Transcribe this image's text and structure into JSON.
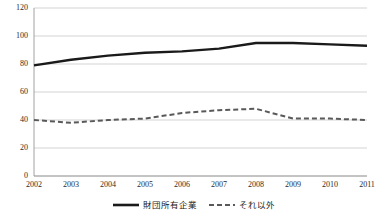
{
  "chart_data": {
    "type": "line",
    "title": "",
    "subtitle": "",
    "xlabel": "",
    "ylabel": "",
    "x": [
      2002,
      2003,
      2004,
      2005,
      2006,
      2007,
      2008,
      2009,
      2010,
      2011
    ],
    "categories": [
      "2002",
      "2003",
      "2004",
      "2005",
      "2006",
      "2007",
      "2008",
      "2009",
      "2010",
      "2011"
    ],
    "series": [
      {
        "name": "財団所有企業",
        "style": "solid",
        "color": "#1a1a1a",
        "values": [
          79,
          83,
          86,
          88,
          89,
          91,
          95,
          95,
          94,
          93
        ]
      },
      {
        "name": "それ以外",
        "style": "dashed",
        "color": "#595959",
        "values": [
          40,
          38,
          40,
          41,
          45,
          47,
          48,
          41,
          41,
          40
        ]
      }
    ],
    "ylim": [
      0,
      120
    ],
    "yticks": [
      0,
      20,
      40,
      60,
      80,
      100,
      120
    ],
    "ytick_labels": [
      "0",
      "20",
      "40",
      "60",
      "80",
      "100",
      "120"
    ],
    "xtick_labels": [
      "2002",
      "2003",
      "2004",
      "2005",
      "2006",
      "2007",
      "2008",
      "2009",
      "2010",
      "2011"
    ],
    "grid": "horizontal",
    "legend_position": "bottom",
    "legend": [
      "財団所有企業",
      "それ以外"
    ]
  },
  "colors": {
    "series_solid": "#1a1a1a",
    "series_dashed": "#595959",
    "gridline": "#c8c8c8",
    "axis": "#808080",
    "text": "#2b2b2b",
    "background": "#ffffff"
  }
}
